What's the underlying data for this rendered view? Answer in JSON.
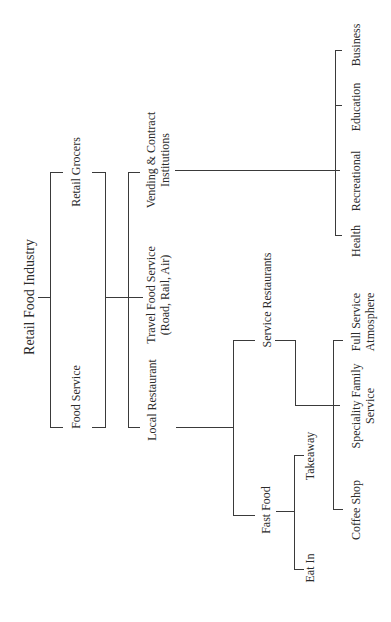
{
  "diagram": {
    "title": "Retail Food Industry",
    "orientation": "rotated-90-ccw",
    "level1": {
      "retail_grocers": "Retail Grocers",
      "food_service": "Food Service"
    },
    "level2": {
      "vending": {
        "line1": "Vending & Contract",
        "line2": "Institutions"
      },
      "travel": {
        "line1": "Travel Food Service",
        "line2": "(Road, Rail, Air)"
      },
      "local": "Local Restaurant"
    },
    "institutions": {
      "health": "Health",
      "recreational": "Recreational",
      "education": "Education",
      "business": "Business"
    },
    "local_restaurant": {
      "service_restaurants": "Service Restaurants",
      "fast_food": "Fast Food"
    },
    "service_restaurants": {
      "full_service": {
        "line1": "Full Service",
        "line2": "Atmosphere"
      },
      "speciality": {
        "line1": "Speciality Family",
        "line2": "Service"
      },
      "coffee_shop": "Coffee Shop"
    },
    "fast_food": {
      "takeaway": "Takeaway",
      "eat_in": "Eat In"
    },
    "line_color": "#3a3a3a"
  }
}
